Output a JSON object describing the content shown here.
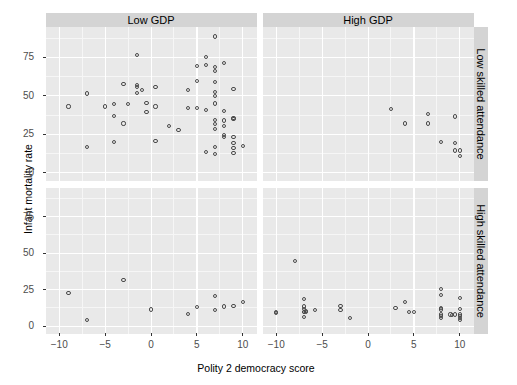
{
  "chart_data": {
    "type": "scatter",
    "title": "",
    "xlabel": "Polity 2 democracy score",
    "ylabel": "Infant mortality rate",
    "xlim": [
      -11.5,
      11.5
    ],
    "ylim": [
      -5,
      95
    ],
    "xticks": [
      -10,
      -5,
      0,
      5,
      10
    ],
    "xticklabels": [
      "−10",
      "−5",
      "0",
      "5",
      "10"
    ],
    "yticks": [
      0,
      25,
      50,
      75
    ],
    "yticklabels": [
      "0",
      "25",
      "50",
      "75"
    ],
    "grid": true,
    "legend": "none",
    "facet_cols": [
      "Low GDP",
      "High GDP"
    ],
    "facet_rows": [
      "Low skilled attendance",
      "High skilled attendance"
    ],
    "marker": "open-circle",
    "marker_color": "#4a4a4a",
    "panel_background": "#e9e9e9",
    "strip_background": "#d4d4d4",
    "panels": [
      {
        "row": "Low skilled attendance",
        "col": "Low GDP",
        "points": [
          [
            -9.0,
            43.0
          ],
          [
            -7.0,
            51.5
          ],
          [
            -7.0,
            17.0
          ],
          [
            -5.0,
            43.0
          ],
          [
            -4.0,
            44.5
          ],
          [
            -4.0,
            37.0
          ],
          [
            -4.0,
            20.0
          ],
          [
            -3.0,
            57.5
          ],
          [
            -3.0,
            32.0
          ],
          [
            -2.5,
            44.5
          ],
          [
            -1.5,
            76.5
          ],
          [
            -1.5,
            55.5
          ],
          [
            -1.5,
            52.0
          ],
          [
            -1.5,
            57.0
          ],
          [
            -1.0,
            54.0
          ],
          [
            -0.5,
            45.5
          ],
          [
            -0.5,
            39.5
          ],
          [
            0.5,
            55.5
          ],
          [
            0.5,
            43.0
          ],
          [
            0.5,
            20.5
          ],
          [
            2.0,
            30.5
          ],
          [
            3.0,
            28.0
          ],
          [
            4.0,
            42.0
          ],
          [
            4.0,
            54.0
          ],
          [
            5.0,
            69.5
          ],
          [
            5.0,
            59.5
          ],
          [
            5.0,
            42.0
          ],
          [
            6.0,
            75.0
          ],
          [
            6.0,
            70.0
          ],
          [
            6.0,
            41.0
          ],
          [
            6.0,
            13.5
          ],
          [
            7.0,
            88.5
          ],
          [
            7.0,
            68.5
          ],
          [
            7.0,
            66.0
          ],
          [
            7.0,
            59.0
          ],
          [
            7.0,
            52.5
          ],
          [
            7.0,
            50.0
          ],
          [
            7.0,
            45.0
          ],
          [
            7.0,
            34.5
          ],
          [
            7.0,
            31.5
          ],
          [
            7.0,
            28.5
          ],
          [
            7.0,
            16.5
          ],
          [
            7.0,
            12.0
          ],
          [
            8.0,
            71.5
          ],
          [
            8.0,
            40.0
          ],
          [
            8.0,
            34.0
          ],
          [
            8.0,
            30.5
          ],
          [
            8.0,
            24.5
          ],
          [
            8.0,
            23.5
          ],
          [
            9.0,
            54.5
          ],
          [
            9.0,
            35.5
          ],
          [
            9.0,
            35.0
          ],
          [
            9.0,
            23.5
          ],
          [
            9.0,
            19.5
          ],
          [
            9.0,
            16.0
          ],
          [
            9.0,
            13.0
          ],
          [
            10.0,
            17.5
          ]
        ]
      },
      {
        "row": "Low skilled attendance",
        "col": "High GDP",
        "points": [
          [
            2.5,
            41.5
          ],
          [
            4.0,
            32.0
          ],
          [
            6.5,
            38.0
          ],
          [
            6.5,
            32.0
          ],
          [
            8.0,
            20.0
          ],
          [
            9.5,
            36.5
          ],
          [
            9.5,
            19.5
          ],
          [
            9.5,
            14.5
          ],
          [
            10.0,
            14.5
          ],
          [
            10.0,
            11.0
          ]
        ]
      },
      {
        "row": "High skilled attendance",
        "col": "Low GDP",
        "points": [
          [
            -9.0,
            23.0
          ],
          [
            -7.0,
            4.0
          ],
          [
            -3.0,
            31.5
          ],
          [
            0.0,
            11.5
          ],
          [
            4.0,
            8.5
          ],
          [
            5.0,
            13.0
          ],
          [
            7.0,
            20.5
          ],
          [
            7.0,
            11.0
          ],
          [
            8.0,
            13.5
          ],
          [
            9.0,
            14.0
          ],
          [
            10.0,
            16.5
          ]
        ]
      },
      {
        "row": "High skilled attendance",
        "col": "High GDP",
        "points": [
          [
            -10.0,
            9.5
          ],
          [
            -10.0,
            9.0
          ],
          [
            -8.0,
            44.5
          ],
          [
            -7.0,
            18.5
          ],
          [
            -7.0,
            13.5
          ],
          [
            -7.0,
            12.0
          ],
          [
            -7.0,
            10.0
          ],
          [
            -7.0,
            9.5
          ],
          [
            -7.0,
            6.5
          ],
          [
            -6.8,
            10.5
          ],
          [
            -6.8,
            9.5
          ],
          [
            -5.8,
            11.0
          ],
          [
            -3.0,
            14.0
          ],
          [
            -3.0,
            11.0
          ],
          [
            -2.0,
            5.5
          ],
          [
            3.0,
            12.5
          ],
          [
            4.0,
            16.5
          ],
          [
            4.5,
            10.0
          ],
          [
            5.0,
            9.5
          ],
          [
            8.0,
            25.5
          ],
          [
            8.0,
            21.5
          ],
          [
            8.0,
            12.5
          ],
          [
            8.0,
            11.5
          ],
          [
            8.0,
            8.0
          ],
          [
            8.0,
            7.0
          ],
          [
            8.0,
            5.5
          ],
          [
            9.0,
            8.0
          ],
          [
            9.2,
            7.5
          ],
          [
            9.5,
            8.0
          ],
          [
            10.0,
            19.5
          ],
          [
            10.0,
            12.0
          ],
          [
            10.0,
            8.0
          ],
          [
            10.0,
            7.0
          ],
          [
            10.0,
            5.5
          ],
          [
            10.0,
            4.5
          ]
        ]
      }
    ]
  },
  "figure": {
    "y_axis_title": "Infant mortality rate",
    "x_axis_title": "Polity 2 democracy score",
    "strip_top_left": "Low GDP",
    "strip_top_right": "High GDP",
    "strip_right_top": "Low skilled attendance",
    "strip_right_bottom": "High skilled attendance"
  }
}
